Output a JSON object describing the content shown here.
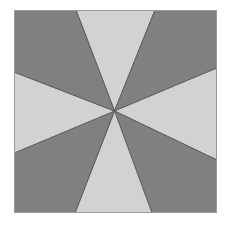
{
  "image": {
    "width": 229,
    "height": 225,
    "background_color": "#ffffff",
    "description": "Eight-wedge pinwheel pattern inside a square"
  },
  "figure": {
    "name": "wedge-pattern-square",
    "left": 14,
    "top": 10,
    "width": 203,
    "height": 203,
    "border_color": "#9a9a9a",
    "border_width": 1
  },
  "palette": {
    "light_gray": "#d2d2d2",
    "dark_gray": "#808080",
    "edge_line": "#5a5a5a",
    "outer_border": "#9a9a9a",
    "background": "#ffffff"
  },
  "geometry": {
    "viewbox": "0 0 203 203",
    "center": {
      "x": 100.5,
      "y": 101.0
    },
    "corners": {
      "top_left": {
        "x": 0,
        "y": 0
      },
      "top_right": {
        "x": 203,
        "y": 0
      },
      "bottom_right": {
        "x": 203,
        "y": 203
      },
      "bottom_left": {
        "x": 0,
        "y": 203
      }
    },
    "rim_points": [
      {
        "name": "top-left-of-top-wedge",
        "x": 62,
        "y": 0
      },
      {
        "name": "top-right-of-top-wedge",
        "x": 141,
        "y": 0
      },
      {
        "name": "right-upper",
        "x": 203,
        "y": 58
      },
      {
        "name": "right-lower",
        "x": 203,
        "y": 150
      },
      {
        "name": "bottom-right-of-bottom-wedge",
        "x": 138,
        "y": 203
      },
      {
        "name": "bottom-left-of-bottom-wedge",
        "x": 61,
        "y": 203
      },
      {
        "name": "left-lower",
        "x": 0,
        "y": 143
      },
      {
        "name": "left-upper",
        "x": 0,
        "y": 62
      }
    ]
  },
  "wedges": [
    {
      "name": "wedge-top",
      "fill": "light_gray",
      "orientation": "up",
      "points": "62,0 141,0 100.5,101"
    },
    {
      "name": "wedge-top-right",
      "fill": "dark_gray",
      "orientation": "upper-right",
      "points": "141,0 203,0 203,58 100.5,101"
    },
    {
      "name": "wedge-right",
      "fill": "light_gray",
      "orientation": "right",
      "points": "203,58 203,150 100.5,101"
    },
    {
      "name": "wedge-bottom-right",
      "fill": "dark_gray",
      "orientation": "lower-right",
      "points": "203,150 203,203 138,203 100.5,101"
    },
    {
      "name": "wedge-bottom",
      "fill": "light_gray",
      "orientation": "down",
      "points": "138,203 61,203 100.5,101"
    },
    {
      "name": "wedge-bottom-left",
      "fill": "dark_gray",
      "orientation": "lower-left",
      "points": "61,203 0,203 0,143 100.5,101"
    },
    {
      "name": "wedge-left",
      "fill": "light_gray",
      "orientation": "left",
      "points": "0,143 0,62 100.5,101"
    },
    {
      "name": "wedge-top-left",
      "fill": "dark_gray",
      "orientation": "upper-left",
      "points": "0,62 0,0 62,0 100.5,101"
    }
  ]
}
